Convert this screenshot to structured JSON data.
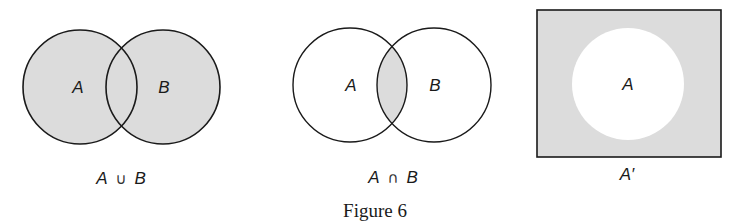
{
  "figure": {
    "caption": "Figure 6",
    "colors": {
      "shade": "#dcdcdc",
      "stroke": "#1a1a1a",
      "background": "#ffffff"
    }
  },
  "panels": [
    {
      "name": "union",
      "circle_a_label": "A",
      "circle_b_label": "B",
      "expr_left": "A",
      "expr_op": "∪",
      "expr_right": "B",
      "shaded_region": "A ∪ B"
    },
    {
      "name": "intersection",
      "circle_a_label": "A",
      "circle_b_label": "B",
      "expr_left": "A",
      "expr_op": "∩",
      "expr_right": "B",
      "shaded_region": "A ∩ B"
    },
    {
      "name": "complement",
      "circle_a_label": "A",
      "expr": "A′",
      "shaded_region": "A′"
    }
  ]
}
